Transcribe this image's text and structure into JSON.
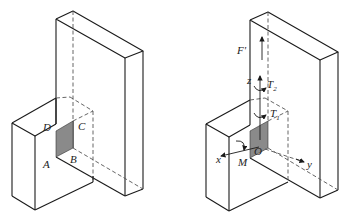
{
  "figure_left": {
    "description": "Tall vertical slab with a small box attached; shaded rectangular contact area ABCD",
    "labels": {
      "A": "A",
      "B": "B",
      "C": "C",
      "D": "D"
    },
    "shade_color": "#8a8a8a"
  },
  "figure_right": {
    "description": "Same assembly with coordinate axes and loads at the contact centroid O",
    "labels": {
      "F": "F'",
      "z": "z",
      "T2": "T",
      "T2_sub": "2",
      "T1": "T",
      "T1_sub": "1",
      "x": "x",
      "M": "M",
      "O": "O",
      "y": "y"
    },
    "shade_color": "#8a8a8a"
  }
}
